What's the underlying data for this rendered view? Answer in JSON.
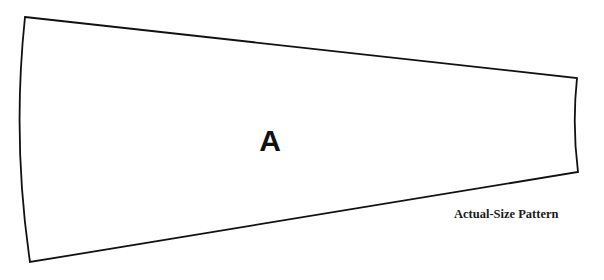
{
  "pattern": {
    "piece_label": "A",
    "caption": "Actual-Size Pattern",
    "outline_color": "#111111",
    "background_color": "#ffffff",
    "shape": "tapered-wedge",
    "corners": {
      "top_left": [
        25,
        17
      ],
      "top_right": [
        577,
        78
      ],
      "bottom_right": [
        578,
        172
      ],
      "bottom_left": [
        30,
        262
      ]
    }
  }
}
